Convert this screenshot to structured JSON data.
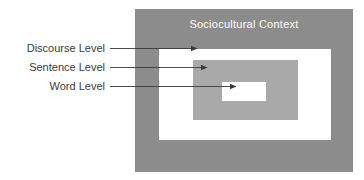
{
  "diagram": {
    "title": "Sociocultural Context",
    "boxes": [
      {
        "name": "sociocultural-context",
        "label": "Sociocultural Context",
        "fill": "#8c8c8c"
      },
      {
        "name": "discourse-level",
        "label": "",
        "fill": "#ffffff"
      },
      {
        "name": "sentence-level",
        "label": "",
        "fill": "#a9a9a9"
      },
      {
        "name": "word-level",
        "label": "",
        "fill": "#ffffff"
      }
    ],
    "callouts": [
      {
        "label": "Discourse Level",
        "target": "discourse-level"
      },
      {
        "label": "Sentence Level",
        "target": "sentence-level"
      },
      {
        "label": "Word Level",
        "target": "word-level"
      }
    ],
    "colors": {
      "outer_fill": "#8c8c8c",
      "middle_fill": "#ffffff",
      "inner_fill": "#a9a9a9",
      "core_fill": "#ffffff",
      "title_text": "#ffffff",
      "label_text": "#3a3a3a",
      "leader_line": "#3a3a3a",
      "page_background": "#ffffff"
    }
  }
}
